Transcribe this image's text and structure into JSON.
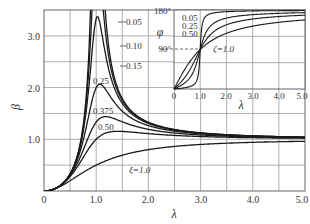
{
  "chart_data": [
    {
      "type": "line",
      "title": "",
      "xlabel": "λ",
      "ylabel": "β",
      "xlim": [
        0,
        5.0
      ],
      "ylim": [
        0,
        3.5
      ],
      "grid": true,
      "x_ticks": [
        "0",
        "1.0",
        "2.0",
        "3.0",
        "4.0",
        "5.0"
      ],
      "y_ticks": [
        "1.0",
        "2.0",
        "3.0"
      ],
      "formula": "β = λ² / sqrt((1-λ²)² + (2ζλ)²)",
      "series": [
        {
          "name": "0.05",
          "zeta": 0.05,
          "label": "0.05",
          "x": [
            0,
            0.5,
            0.8,
            0.9,
            1.0,
            1.5,
            2.0,
            3.0,
            4.0,
            5.0
          ],
          "values": [
            0,
            0.33,
            1.77,
            4.18,
            10.0,
            1.8,
            1.33,
            1.12,
            1.07,
            1.04
          ]
        },
        {
          "name": "0.10",
          "zeta": 0.1,
          "label": "0.10",
          "x": [
            0,
            0.5,
            0.8,
            0.9,
            1.0,
            1.5,
            2.0,
            3.0,
            4.0,
            5.0
          ],
          "values": [
            0,
            0.33,
            1.69,
            3.24,
            5.0,
            1.77,
            1.32,
            1.12,
            1.07,
            1.04
          ]
        },
        {
          "name": "0.15",
          "zeta": 0.15,
          "label": "0.15",
          "x": [
            0,
            0.5,
            0.8,
            0.9,
            1.0,
            1.5,
            2.0,
            3.0,
            4.0,
            5.0
          ],
          "values": [
            0,
            0.33,
            1.57,
            2.52,
            3.33,
            1.73,
            1.31,
            1.12,
            1.06,
            1.04
          ]
        },
        {
          "name": "0.25",
          "zeta": 0.25,
          "label": "0.25",
          "x": [
            0,
            0.5,
            0.8,
            0.9,
            1.0,
            1.5,
            2.0,
            3.0,
            4.0,
            5.0
          ],
          "values": [
            0,
            0.32,
            1.31,
            1.67,
            2.0,
            1.61,
            1.28,
            1.11,
            1.06,
            1.04
          ]
        },
        {
          "name": "0.375",
          "zeta": 0.375,
          "label": "0.375",
          "x": [
            0,
            0.5,
            0.8,
            0.9,
            1.0,
            1.5,
            2.0,
            3.0,
            4.0,
            5.0
          ],
          "values": [
            0,
            0.31,
            1.03,
            1.2,
            1.33,
            1.43,
            1.23,
            1.1,
            1.06,
            1.04
          ]
        },
        {
          "name": "0.50",
          "zeta": 0.5,
          "label": "0.50",
          "x": [
            0,
            0.5,
            0.8,
            0.9,
            1.0,
            1.5,
            2.0,
            3.0,
            4.0,
            5.0
          ],
          "values": [
            0,
            0.28,
            0.82,
            0.92,
            1.0,
            1.25,
            1.16,
            1.08,
            1.05,
            1.03
          ]
        },
        {
          "name": "ξ=1.0",
          "zeta": 1.0,
          "label": "ξ=1.0",
          "x": [
            0,
            0.5,
            0.8,
            0.9,
            1.0,
            1.5,
            2.0,
            3.0,
            4.0,
            5.0
          ],
          "values": [
            0,
            0.2,
            0.39,
            0.45,
            0.5,
            0.69,
            0.8,
            0.9,
            0.94,
            0.96
          ]
        }
      ]
    },
    {
      "type": "line",
      "title": "",
      "xlabel": "λ",
      "ylabel": "φ",
      "xlim": [
        0,
        5.0
      ],
      "ylim": [
        0,
        180
      ],
      "grid": true,
      "x_ticks": [
        "0",
        "1.0",
        "2.0",
        "3.0",
        "4.0",
        "5.0"
      ],
      "y_ticks": [
        "90°",
        "180°"
      ],
      "formula": "φ = atan2(2ζλ, 1-λ²)",
      "annotations": [
        "dashed line at 90°"
      ],
      "series": [
        {
          "name": "0.05",
          "zeta": 0.05,
          "label": "0.05",
          "x": [
            0,
            0.5,
            1.0,
            2.0,
            3.0,
            5.0
          ],
          "values": [
            0,
            3.8,
            90,
            176.2,
            177.9,
            178.8
          ]
        },
        {
          "name": "0.25",
          "zeta": 0.25,
          "label": "0.25",
          "x": [
            0,
            0.5,
            1.0,
            2.0,
            3.0,
            5.0
          ],
          "values": [
            0,
            18.4,
            90,
            161.6,
            169.4,
            174.0
          ]
        },
        {
          "name": "0.50",
          "zeta": 0.5,
          "label": "0.50",
          "x": [
            0,
            0.5,
            1.0,
            2.0,
            3.0,
            5.0
          ],
          "values": [
            0,
            33.7,
            90,
            146.3,
            159.4,
            168.2
          ]
        },
        {
          "name": "ζ=1.0",
          "zeta": 1.0,
          "label": "ζ=1.0",
          "x": [
            0,
            0.5,
            1.0,
            2.0,
            3.0,
            5.0
          ],
          "values": [
            0,
            53.1,
            90,
            126.9,
            143.1,
            157.4
          ]
        }
      ]
    }
  ],
  "main": {
    "ylabel": "β",
    "xlabel": "λ",
    "x_ticks": [
      "0",
      "1.0",
      "2.0",
      "3.0",
      "4.0",
      "5.0"
    ],
    "y_ticks": [
      "1.0",
      "2.0",
      "3.0"
    ],
    "labels": [
      "0.05",
      "0.10",
      "0.15",
      "0.25",
      "0.375",
      "0.50",
      "ξ=1.0"
    ]
  },
  "inset": {
    "ylabel": "φ",
    "xlabel": "λ",
    "x_ticks": [
      "0",
      "1.0",
      "2.0",
      "3.0",
      "4.0",
      "5.0"
    ],
    "y_ticks": [
      "180°",
      "90°"
    ],
    "labels": [
      "0.05",
      "0.25",
      "0.50",
      "ζ=1.0"
    ]
  }
}
